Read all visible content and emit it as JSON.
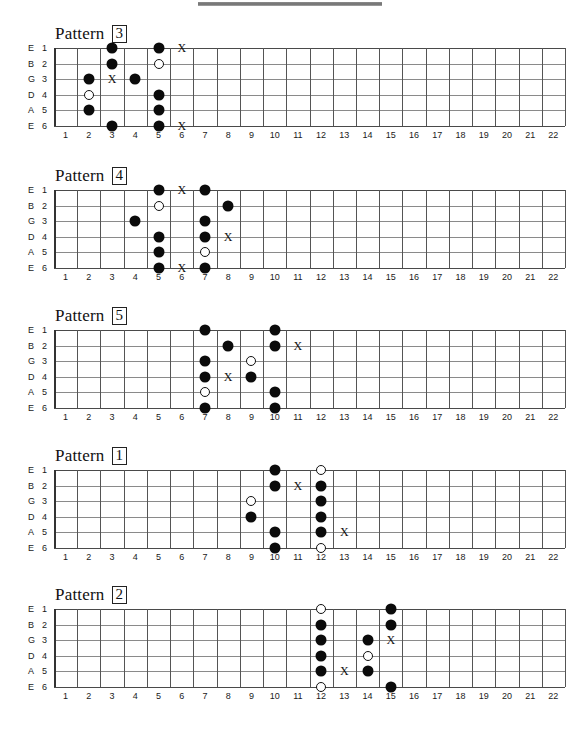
{
  "document": {
    "top_bar": "gray-divider-bar",
    "fret_count": 22,
    "string_names": [
      "E",
      "B",
      "G",
      "D",
      "A",
      "E"
    ],
    "string_numbers": [
      "1",
      "2",
      "3",
      "4",
      "5",
      "6"
    ],
    "fret_numbers": [
      "1",
      "2",
      "3",
      "4",
      "5",
      "6",
      "7",
      "8",
      "9",
      "10",
      "11",
      "12",
      "13",
      "14",
      "15",
      "16",
      "17",
      "18",
      "19",
      "20",
      "21",
      "22"
    ],
    "title_word": "Pattern",
    "marker_legend": {
      "filled": "filled-dot",
      "open": "open-circle",
      "cross": "X"
    }
  },
  "patterns": [
    {
      "number": "3",
      "title": "Pattern",
      "markers": [
        {
          "string": 1,
          "fret": 3,
          "type": "filled"
        },
        {
          "string": 1,
          "fret": 5,
          "type": "filled"
        },
        {
          "string": 1,
          "fret": 6,
          "type": "cross",
          "label": "X"
        },
        {
          "string": 2,
          "fret": 3,
          "type": "filled"
        },
        {
          "string": 2,
          "fret": 5,
          "type": "open"
        },
        {
          "string": 3,
          "fret": 2,
          "type": "filled"
        },
        {
          "string": 3,
          "fret": 3,
          "type": "cross",
          "label": "X"
        },
        {
          "string": 3,
          "fret": 4,
          "type": "filled"
        },
        {
          "string": 4,
          "fret": 2,
          "type": "open"
        },
        {
          "string": 4,
          "fret": 5,
          "type": "filled"
        },
        {
          "string": 5,
          "fret": 2,
          "type": "filled"
        },
        {
          "string": 5,
          "fret": 5,
          "type": "filled"
        },
        {
          "string": 6,
          "fret": 3,
          "type": "filled"
        },
        {
          "string": 6,
          "fret": 5,
          "type": "filled"
        },
        {
          "string": 6,
          "fret": 6,
          "type": "cross",
          "label": "X"
        }
      ]
    },
    {
      "number": "4",
      "title": "Pattern",
      "markers": [
        {
          "string": 1,
          "fret": 5,
          "type": "filled"
        },
        {
          "string": 1,
          "fret": 6,
          "type": "cross",
          "label": "X"
        },
        {
          "string": 1,
          "fret": 7,
          "type": "filled"
        },
        {
          "string": 2,
          "fret": 5,
          "type": "open"
        },
        {
          "string": 2,
          "fret": 8,
          "type": "filled"
        },
        {
          "string": 3,
          "fret": 4,
          "type": "filled"
        },
        {
          "string": 3,
          "fret": 7,
          "type": "filled"
        },
        {
          "string": 4,
          "fret": 5,
          "type": "filled"
        },
        {
          "string": 4,
          "fret": 7,
          "type": "filled"
        },
        {
          "string": 4,
          "fret": 8,
          "type": "cross",
          "label": "X"
        },
        {
          "string": 5,
          "fret": 5,
          "type": "filled"
        },
        {
          "string": 5,
          "fret": 7,
          "type": "open"
        },
        {
          "string": 6,
          "fret": 5,
          "type": "filled"
        },
        {
          "string": 6,
          "fret": 6,
          "type": "cross",
          "label": "X"
        },
        {
          "string": 6,
          "fret": 7,
          "type": "filled"
        }
      ]
    },
    {
      "number": "5",
      "title": "Pattern",
      "markers": [
        {
          "string": 1,
          "fret": 7,
          "type": "filled"
        },
        {
          "string": 1,
          "fret": 10,
          "type": "filled"
        },
        {
          "string": 2,
          "fret": 8,
          "type": "filled"
        },
        {
          "string": 2,
          "fret": 10,
          "type": "filled"
        },
        {
          "string": 2,
          "fret": 11,
          "type": "cross",
          "label": "X"
        },
        {
          "string": 3,
          "fret": 7,
          "type": "filled"
        },
        {
          "string": 3,
          "fret": 9,
          "type": "open"
        },
        {
          "string": 4,
          "fret": 7,
          "type": "filled"
        },
        {
          "string": 4,
          "fret": 8,
          "type": "cross",
          "label": "X"
        },
        {
          "string": 4,
          "fret": 9,
          "type": "filled"
        },
        {
          "string": 5,
          "fret": 7,
          "type": "open"
        },
        {
          "string": 5,
          "fret": 10,
          "type": "filled"
        },
        {
          "string": 6,
          "fret": 7,
          "type": "filled"
        },
        {
          "string": 6,
          "fret": 10,
          "type": "filled"
        }
      ]
    },
    {
      "number": "1",
      "title": "Pattern",
      "markers": [
        {
          "string": 1,
          "fret": 10,
          "type": "filled"
        },
        {
          "string": 1,
          "fret": 12,
          "type": "open"
        },
        {
          "string": 2,
          "fret": 10,
          "type": "filled"
        },
        {
          "string": 2,
          "fret": 11,
          "type": "cross",
          "label": "X"
        },
        {
          "string": 2,
          "fret": 12,
          "type": "filled"
        },
        {
          "string": 3,
          "fret": 9,
          "type": "open"
        },
        {
          "string": 3,
          "fret": 12,
          "type": "filled"
        },
        {
          "string": 4,
          "fret": 9,
          "type": "filled"
        },
        {
          "string": 4,
          "fret": 12,
          "type": "filled"
        },
        {
          "string": 5,
          "fret": 10,
          "type": "filled"
        },
        {
          "string": 5,
          "fret": 12,
          "type": "filled"
        },
        {
          "string": 5,
          "fret": 13,
          "type": "cross",
          "label": "X"
        },
        {
          "string": 6,
          "fret": 10,
          "type": "filled"
        },
        {
          "string": 6,
          "fret": 12,
          "type": "open"
        }
      ]
    },
    {
      "number": "2",
      "title": "Pattern",
      "markers": [
        {
          "string": 1,
          "fret": 12,
          "type": "open"
        },
        {
          "string": 1,
          "fret": 15,
          "type": "filled"
        },
        {
          "string": 2,
          "fret": 12,
          "type": "filled"
        },
        {
          "string": 2,
          "fret": 15,
          "type": "filled"
        },
        {
          "string": 3,
          "fret": 12,
          "type": "filled"
        },
        {
          "string": 3,
          "fret": 14,
          "type": "filled"
        },
        {
          "string": 3,
          "fret": 15,
          "type": "cross",
          "label": "X"
        },
        {
          "string": 4,
          "fret": 12,
          "type": "filled"
        },
        {
          "string": 4,
          "fret": 14,
          "type": "open"
        },
        {
          "string": 5,
          "fret": 12,
          "type": "filled"
        },
        {
          "string": 5,
          "fret": 13,
          "type": "cross",
          "label": "X"
        },
        {
          "string": 5,
          "fret": 14,
          "type": "filled"
        },
        {
          "string": 6,
          "fret": 12,
          "type": "open"
        },
        {
          "string": 6,
          "fret": 15,
          "type": "filled"
        }
      ]
    }
  ]
}
